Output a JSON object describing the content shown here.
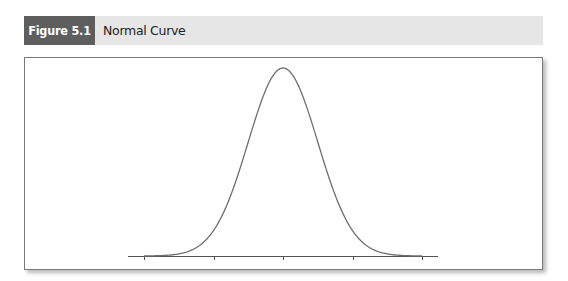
{
  "figure": {
    "label": "Figure 5.1",
    "title": "Normal Curve",
    "colors": {
      "label_bg": "#5e5e5e",
      "bar_bg": "#e6e6e6",
      "curve": "#6e6e6e",
      "axis": "#555555"
    }
  },
  "chart_data": {
    "type": "line",
    "title": "Normal Curve",
    "xlabel": "",
    "ylabel": "",
    "distribution": "standard normal",
    "mean": 0,
    "sd": 1,
    "x_range": [
      -4,
      4
    ],
    "x_ticks": [
      -4,
      -2,
      0,
      2,
      4
    ],
    "x_tick_labels": [
      "",
      "",
      "",
      "",
      ""
    ],
    "x": [
      -4,
      -3.5,
      -3,
      -2.5,
      -2,
      -1.5,
      -1,
      -0.5,
      0,
      0.5,
      1,
      1.5,
      2,
      2.5,
      3,
      3.5,
      4
    ],
    "values": [
      0.0001,
      0.0009,
      0.0044,
      0.0175,
      0.054,
      0.1295,
      0.242,
      0.3521,
      0.3989,
      0.3521,
      0.242,
      0.1295,
      0.054,
      0.0175,
      0.0044,
      0.0009,
      0.0001
    ],
    "grid": false,
    "legend": null
  }
}
